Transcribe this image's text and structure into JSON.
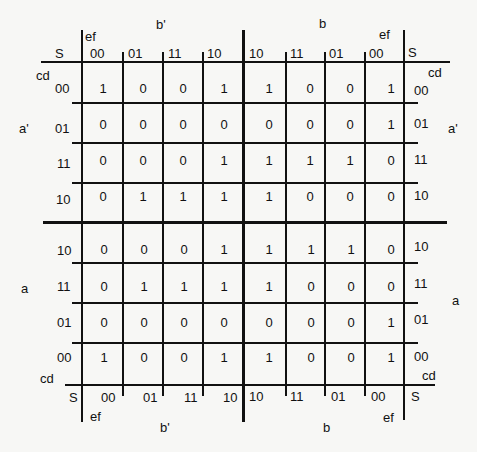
{
  "labels": {
    "S": "S",
    "ef": "ef",
    "cd": "cd",
    "b_prime": "b'",
    "b": "b",
    "a_prime": "a'",
    "a": "a"
  },
  "column_codes_left": [
    "00",
    "01",
    "11",
    "10"
  ],
  "column_codes_right": [
    "10",
    "11",
    "01",
    "00"
  ],
  "row_codes_top": [
    "00",
    "01",
    "11",
    "10"
  ],
  "row_codes_bottom": [
    "10",
    "11",
    "01",
    "00"
  ],
  "cells": {
    "top": [
      [
        "1",
        "0",
        "0",
        "1",
        "1",
        "0",
        "0",
        "1"
      ],
      [
        "0",
        "0",
        "0",
        "0",
        "0",
        "0",
        "0",
        "1"
      ],
      [
        "0",
        "0",
        "0",
        "1",
        "1",
        "1",
        "1",
        "0"
      ],
      [
        "0",
        "1",
        "1",
        "1",
        "1",
        "0",
        "0",
        "0"
      ]
    ],
    "bottom": [
      [
        "0",
        "0",
        "0",
        "1",
        "1",
        "1",
        "1",
        "0"
      ],
      [
        "0",
        "1",
        "1",
        "1",
        "1",
        "0",
        "0",
        "0"
      ],
      [
        "0",
        "0",
        "0",
        "0",
        "0",
        "0",
        "0",
        "1"
      ],
      [
        "1",
        "0",
        "0",
        "1",
        "1",
        "0",
        "0",
        "1"
      ]
    ]
  }
}
